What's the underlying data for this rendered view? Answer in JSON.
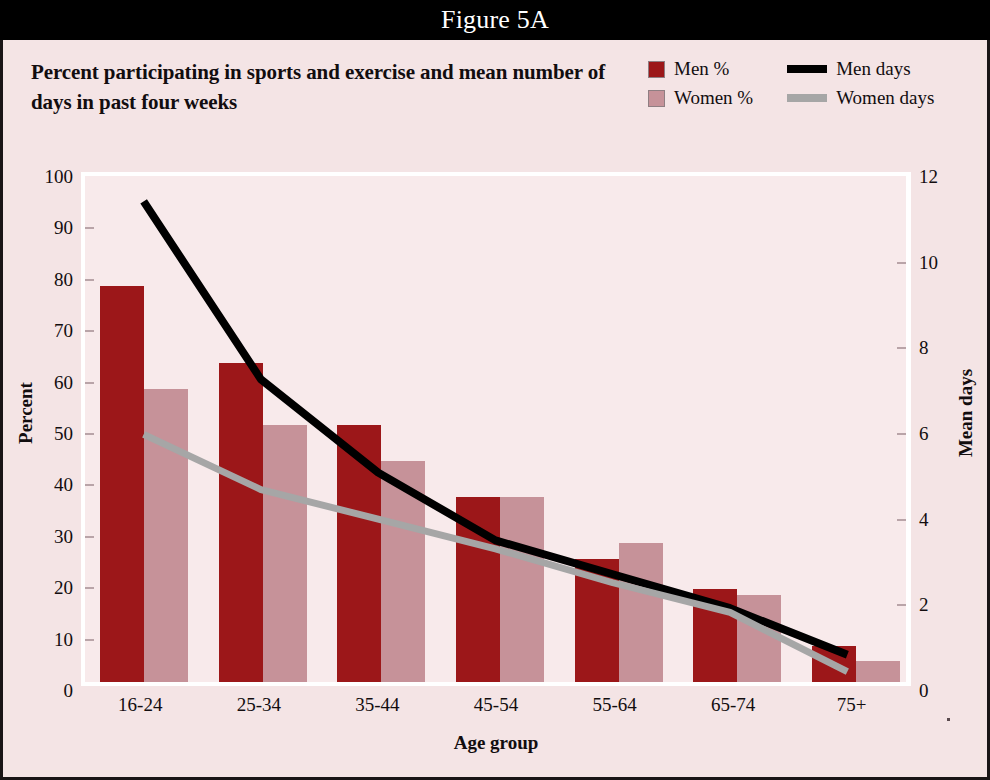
{
  "figure": {
    "title": "Figure 5A",
    "subtitle": "Percent participating in sports and exercise and mean number of days in past four weeks"
  },
  "legend": {
    "position": "top-right",
    "items": [
      {
        "label": "Men %",
        "marker": "square-swatch",
        "color": "#9c1719"
      },
      {
        "label": "Men days",
        "marker": "line-swatch",
        "color": "#000000"
      },
      {
        "label": "Women %",
        "marker": "square-swatch",
        "color": "#c69299"
      },
      {
        "label": "Women days",
        "marker": "line-swatch",
        "color": "#a6a6a6"
      }
    ]
  },
  "colors": {
    "men_bar": "#9c1719",
    "women_bar": "#c69299",
    "men_line": "#000000",
    "women_line": "#a6a6a6",
    "plot_background": "#f8eaeb",
    "figure_background": "#f4e4e5",
    "title_bar_background": "#000000",
    "title_bar_text": "#ffffff",
    "frame": "#1a1416"
  },
  "chart_data": {
    "type": "bar",
    "title": "Figure 5A",
    "subtitle": "Percent participating in sports and exercise and mean number of days in past four weeks",
    "xlabel": "Age group",
    "ylabel": "Percent",
    "y2label": "Mean days",
    "categories": [
      "16-24",
      "25-34",
      "35-44",
      "45-54",
      "55-64",
      "65-74",
      "75+"
    ],
    "ylim": [
      0,
      100
    ],
    "yticks": [
      0,
      10,
      20,
      30,
      40,
      50,
      60,
      70,
      80,
      90,
      100
    ],
    "y2lim": [
      0,
      12
    ],
    "y2ticks": [
      0,
      2,
      4,
      6,
      8,
      10,
      12
    ],
    "grid": false,
    "legend_position": "top-right",
    "series": [
      {
        "name": "Men %",
        "kind": "bar",
        "axis": "left",
        "color": "#9c1719",
        "values": [
          77,
          62,
          50,
          36,
          24,
          18,
          7
        ]
      },
      {
        "name": "Women %",
        "kind": "bar",
        "axis": "left",
        "color": "#c69299",
        "values": [
          57,
          50,
          43,
          36,
          27,
          17,
          4
        ]
      },
      {
        "name": "Men days",
        "kind": "line",
        "axis": "right",
        "color": "#000000",
        "values": [
          11.4,
          7.2,
          5.0,
          3.4,
          2.6,
          1.8,
          0.7
        ]
      },
      {
        "name": "Women days",
        "kind": "line",
        "axis": "right",
        "color": "#a6a6a6",
        "values": [
          5.9,
          4.6,
          3.9,
          3.2,
          2.4,
          1.7,
          0.3
        ]
      }
    ]
  }
}
